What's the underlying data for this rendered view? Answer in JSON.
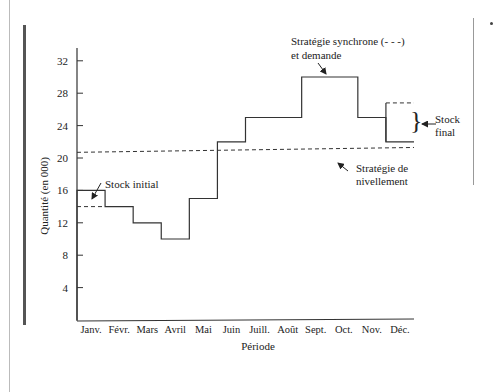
{
  "chart_data": {
    "type": "line",
    "title": "",
    "xlabel": "Période",
    "ylabel": "Quantité (en 000)",
    "ylim": [
      0,
      34
    ],
    "yticks": [
      4,
      8,
      12,
      16,
      20,
      24,
      28,
      32
    ],
    "categories": [
      "Janv.",
      "Févr.",
      "Mars",
      "Avril",
      "Mai",
      "Juin",
      "Juill.",
      "Août",
      "Sept.",
      "Oct.",
      "Nov.",
      "Déc."
    ],
    "grid": false,
    "series": [
      {
        "name": "Stratégie synchrone et demande",
        "style": "step-solid",
        "values": [
          16,
          14,
          12,
          10,
          15,
          22,
          25,
          25,
          30,
          30,
          25,
          22
        ]
      },
      {
        "name": "Stratégie synchrone (- - -)",
        "style": "step-dashed",
        "segments": [
          {
            "category": "Janv.",
            "value": 14
          },
          {
            "category": "Déc.",
            "value": 26.8
          }
        ]
      },
      {
        "name": "Stratégie de nivellement",
        "style": "dashed",
        "from": 20.7,
        "to": 21.3
      }
    ],
    "annotations": [
      {
        "id": "stock-initial",
        "text": "Stock initial"
      },
      {
        "id": "synchrone",
        "text": "Stratégie synchrone (- - -)",
        "text2": "et demande"
      },
      {
        "id": "stock-final",
        "text": "Stock",
        "text2": "final"
      },
      {
        "id": "nivellement",
        "text": "Stratégie de",
        "text2": "nivellement"
      }
    ]
  }
}
